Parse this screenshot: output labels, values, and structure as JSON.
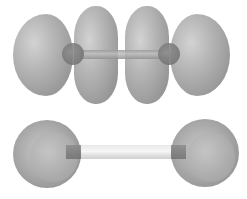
{
  "diagram": {
    "type": "molecular-orbital-illustration",
    "top_molecule": {
      "description": "diatomic molecule with four orbital lobes (two outer, two inner) and central bond",
      "lobe_count": 4,
      "atom_count": 2
    },
    "bottom_molecule": {
      "description": "diatomic molecule with two spherical atoms joined by a bond",
      "atom_count": 2
    },
    "colors": {
      "lobe": "#a0a0a0",
      "atom": "#7a7a7a",
      "bond": "#e6e6e6",
      "background": "#ffffff"
    }
  }
}
